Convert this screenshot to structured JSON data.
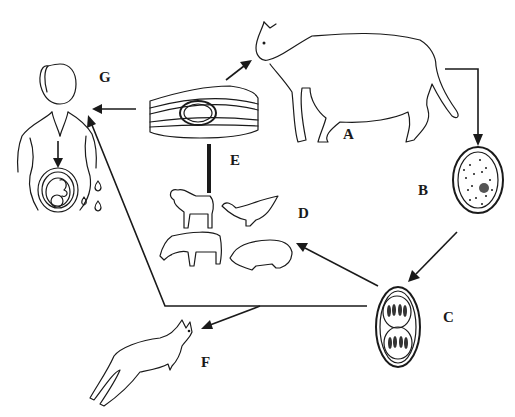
{
  "diagram": {
    "type": "life-cycle",
    "nodes": [
      {
        "id": "A",
        "label": "A",
        "depicts": "cat (definitive host)"
      },
      {
        "id": "B",
        "label": "B",
        "depicts": "unsporulated oocyst"
      },
      {
        "id": "C",
        "label": "C",
        "depicts": "sporulated oocyst with two sporocysts"
      },
      {
        "id": "D",
        "label": "D",
        "depicts": "intermediate hosts: sheep, chicken, cattle, pig"
      },
      {
        "id": "E",
        "label": "E",
        "depicts": "tissue cyst in muscle"
      },
      {
        "id": "F",
        "label": "F",
        "depicts": "kangaroo / marsupial"
      },
      {
        "id": "G",
        "label": "G",
        "depicts": "pregnant human with congenital transmission to fetus"
      }
    ],
    "edges": [
      {
        "from": "A",
        "to": "B"
      },
      {
        "from": "B",
        "to": "C"
      },
      {
        "from": "C",
        "to": "D"
      },
      {
        "from": "C",
        "to": "F"
      },
      {
        "from": "C",
        "to": "G"
      },
      {
        "from": "D",
        "to": "E"
      },
      {
        "from": "E",
        "to": "A"
      },
      {
        "from": "E",
        "to": "G"
      }
    ]
  },
  "labels": {
    "A": "A",
    "B": "B",
    "C": "C",
    "D": "D",
    "E": "E",
    "F": "F",
    "G": "G"
  },
  "colors": {
    "ink": "#1a1a1a",
    "background": "#ffffff"
  }
}
